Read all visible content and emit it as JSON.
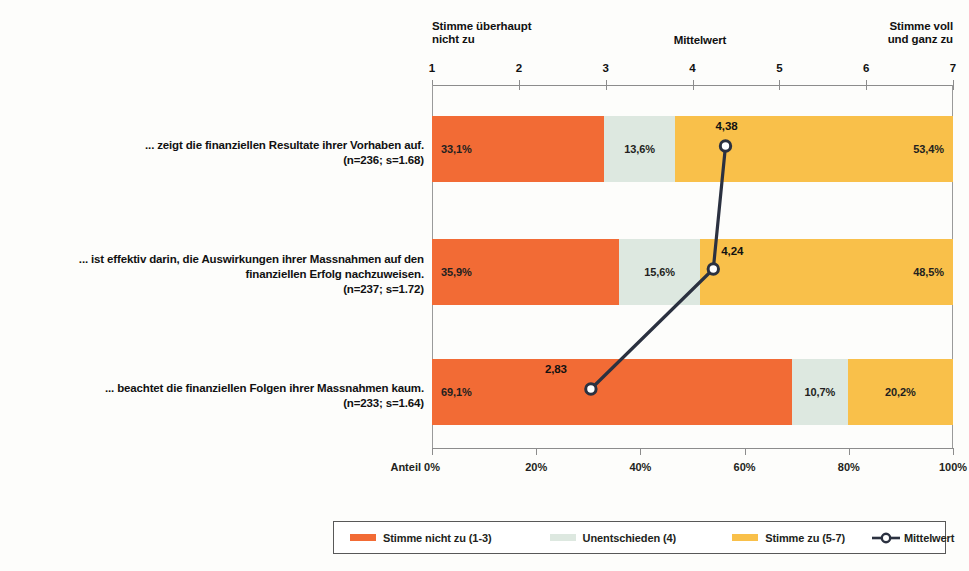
{
  "chart_data": {
    "type": "bar",
    "orientation": "horizontal",
    "stacked": true,
    "stack_unit": "percent",
    "categories": [
      "... zeigt die finanziellen Resultate ihrer Vorhaben auf.",
      "... ist effektiv darin, die Auswirkungen ihrer Massnahmen auf den finanziellen Erfolg nachzuweisen.",
      "... beachtet die finanziellen Folgen ihrer Massnahmen kaum."
    ],
    "series": [
      {
        "name": "Stimme nicht zu (1-3)",
        "color": "#F26B35",
        "values": [
          33.1,
          35.9,
          69.1
        ],
        "labels": [
          "33,1%",
          "35,9%",
          "69,1%"
        ]
      },
      {
        "name": "Unentschieden (4)",
        "color": "#DDE8E0",
        "values": [
          13.6,
          15.6,
          10.7
        ],
        "labels": [
          "13,6%",
          "15,6%",
          "10,7%"
        ]
      },
      {
        "name": "Stimme zu (5-7)",
        "color": "#F9C04A",
        "values": [
          53.4,
          48.5,
          20.2
        ],
        "labels": [
          "53,4%",
          "48,5%",
          "20,2%"
        ]
      }
    ],
    "overlay_series": {
      "name": "Mittelwert",
      "type": "line",
      "color": "#2B3140",
      "marker": "circle-open",
      "values": [
        4.38,
        4.24,
        2.83
      ],
      "labels": [
        "4,38",
        "4,24",
        "2,83"
      ],
      "scale": "top"
    },
    "top_axis": {
      "label": "Mittelwert",
      "ticks": [
        1,
        2,
        3,
        4,
        5,
        6,
        7
      ],
      "tick_labels": [
        "1",
        "2",
        "3",
        "4",
        "5",
        "6",
        "7"
      ],
      "range": [
        1,
        7
      ],
      "left_caption": "Stimme überhaupt nicht zu",
      "right_caption": "Stimme voll und ganz zu"
    },
    "bottom_axis": {
      "label": "Anteil",
      "ticks": [
        0,
        20,
        40,
        60,
        80,
        100
      ],
      "tick_labels": [
        "0%",
        "20%",
        "40%",
        "60%",
        "80%",
        "100%"
      ],
      "range": [
        0,
        100
      ]
    },
    "grid": false,
    "legend_position": "bottom"
  },
  "top_scale": {
    "caption_left_line1": "Stimme überhaupt",
    "caption_left_line2": "nicht zu",
    "caption_mid": "Mittelwert",
    "caption_right_line1": "Stimme voll",
    "caption_right_line2": "und ganz zu",
    "ticks": [
      "1",
      "2",
      "3",
      "4",
      "5",
      "6",
      "7"
    ]
  },
  "rows": [
    {
      "label_line1": "... zeigt die finanziellen Resultate ihrer Vorhaben auf.",
      "label_line2": "(n=236; s=1.68)",
      "n": "236",
      "s": "1.68",
      "neg": "33,1%",
      "neu": "13,6%",
      "pos": "53,4%",
      "mean": "4,38"
    },
    {
      "label_line1": "... ist effektiv darin, die Auswirkungen ihrer Massnahmen auf den",
      "label_line1b": "finanziellen Erfolg nachzuweisen.",
      "label_line2": "(n=237; s=1.72)",
      "n": "237",
      "s": "1.72",
      "neg": "35,9%",
      "neu": "15,6%",
      "pos": "48,5%",
      "mean": "4,24"
    },
    {
      "label_line1": "... beachtet die finanziellen Folgen ihrer Massnahmen kaum.",
      "label_line2": "(n=233; s=1.64)",
      "n": "233",
      "s": "1.64",
      "neg": "69,1%",
      "neu": "10,7%",
      "pos": "20,2%",
      "mean": "2,83"
    }
  ],
  "bottom_scale": {
    "axis_title": "Anteil",
    "ticks": [
      "0%",
      "20%",
      "40%",
      "60%",
      "80%",
      "100%"
    ]
  },
  "legend": {
    "items": [
      {
        "label": "Stimme nicht zu (1-3)",
        "color": "#F26B35"
      },
      {
        "label": "Unentschieden (4)",
        "color": "#DDE8E0"
      },
      {
        "label": "Stimme zu (5-7)",
        "color": "#F9C04A"
      }
    ],
    "mean_label": "Mittelwert"
  },
  "colors": {
    "negative": "#F26B35",
    "neutral": "#DDE8E0",
    "positive": "#F9C04A",
    "mean_line": "#2B3140",
    "axis": "#8C8C8C",
    "text": "#1A1A1A"
  }
}
